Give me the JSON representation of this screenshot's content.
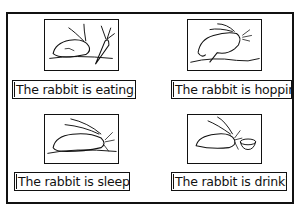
{
  "worksheet": {
    "panels": [
      {
        "id": "eating",
        "caption": "The rabbit is eating.",
        "illustration": "rabbit-eating-carrot"
      },
      {
        "id": "hopping",
        "caption": "The rabbit is hopping.",
        "illustration": "rabbit-hopping"
      },
      {
        "id": "sleeping",
        "caption": "The rabbit is sleeping",
        "illustration": "rabbit-sleeping"
      },
      {
        "id": "drinking",
        "caption": "The rabbit is drinking",
        "illustration": "rabbit-drinking-from-bowl"
      }
    ]
  }
}
